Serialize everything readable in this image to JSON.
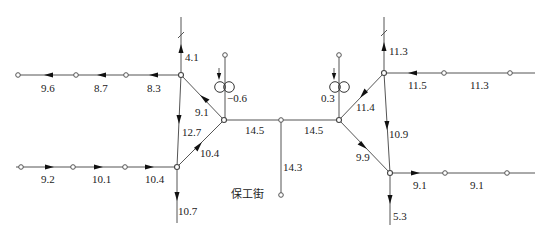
{
  "diagram": {
    "type": "network-flow-diagram",
    "street_label": "保工街",
    "colors": {
      "line": "#555555",
      "arrow": "#111111",
      "text": "#222222",
      "background": "#ffffff"
    },
    "nodes": {
      "left_hub_top": [
        181,
        75
      ],
      "left_hub_bottom": [
        177,
        167
      ],
      "center_left": [
        224,
        120
      ],
      "center_mid": [
        281,
        120
      ],
      "center_right": [
        339,
        120
      ],
      "right_hub_top": [
        384,
        73
      ],
      "right_hub_bottom": [
        390,
        173
      ],
      "mid_branch_end": [
        281,
        195
      ]
    },
    "edge_labels": {
      "top_left_1": "9.6",
      "top_left_2": "8.7",
      "top_left_3": "8.3",
      "left_up": "4.1",
      "left_diag_top": "9.1",
      "left_transformer": "−0.6",
      "left_vertical": "12.7",
      "left_diag_bottom": "10.4",
      "bottom_left_1": "9.2",
      "bottom_left_2": "10.1",
      "bottom_left_3": "10.4",
      "left_down": "10.7",
      "center_left_segment": "14.5",
      "center_right_segment": "14.5",
      "center_branch": "14.3",
      "right_transformer": "0.3",
      "right_diag_top": "11.4",
      "right_up": "11.3",
      "top_right_1": "11.5",
      "top_right_2": "11.3",
      "right_vertical": "10.9",
      "right_diag_bottom": "9.9",
      "bottom_right_1": "9.1",
      "bottom_right_2": "9.1",
      "right_down": "5.3"
    },
    "icons": {
      "transformer": "double-circle-transformer-icon",
      "flow_arrow": "triangle-arrow-icon",
      "node": "open-circle-node-icon",
      "break_mark": "slash-break-icon"
    }
  }
}
